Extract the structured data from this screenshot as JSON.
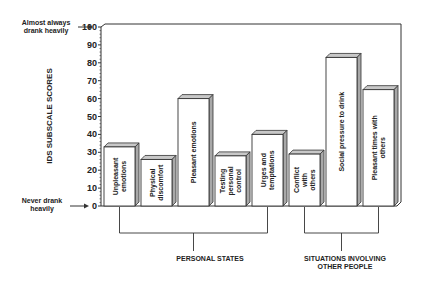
{
  "chart_data": {
    "type": "bar",
    "title": "",
    "xlabel": "",
    "ylabel": "IDS SUBSCALE SCORES",
    "ylim": [
      0,
      100
    ],
    "yticks": [
      0,
      10,
      20,
      30,
      40,
      50,
      60,
      70,
      80,
      90,
      100
    ],
    "grid": false,
    "legend": null,
    "style": "3d-bars",
    "categories": [
      "Unpleasant emotions",
      "Physical discomfort",
      "Pleasant emotions",
      "Testing personal control",
      "Urges and temptations",
      "Conflict with others",
      "Social pressure to drink",
      "Pleasant times with others"
    ],
    "values": [
      33,
      26,
      60,
      28,
      40,
      29,
      83,
      65
    ],
    "groups": [
      {
        "label": "PERSONAL STATES",
        "members": [
          0,
          1,
          2,
          3,
          4
        ]
      },
      {
        "label": "SITUATIONS INVOLVING\nOTHER PEOPLE",
        "members": [
          5,
          6,
          7
        ]
      }
    ],
    "annotations": [
      {
        "text": "Almost always\ndrank heavily",
        "at_y": 100
      },
      {
        "text": "Never drank\nheavily",
        "at_y": 0
      }
    ]
  },
  "labels": {
    "ylabel": "IDS SUBSCALE SCORES",
    "top_anchor_1": "Almost always",
    "top_anchor_2": "drank heavily",
    "bottom_anchor_1": "Never drank",
    "bottom_anchor_2": "heavily",
    "group1": "PERSONAL STATES",
    "group2_1": "SITUATIONS INVOLVING",
    "group2_2": "OTHER PEOPLE"
  }
}
